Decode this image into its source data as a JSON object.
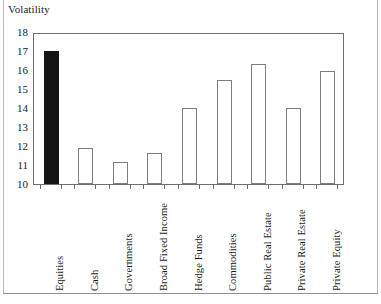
{
  "chart_data": {
    "type": "bar",
    "title": "Volatility",
    "xlabel": "",
    "ylabel": "Volatility",
    "ylim": [
      10,
      18
    ],
    "ytick_labels": [
      "18",
      "17",
      "16",
      "15",
      "14",
      "13",
      "12",
      "11",
      "10"
    ],
    "ytick_values": [
      18,
      17,
      16,
      15,
      14,
      13,
      12,
      11,
      10
    ],
    "grid": false,
    "legend": "none",
    "categories": [
      "Equities",
      "Cash",
      "Governments",
      "Broad Fixed Income",
      "Hedge Funds",
      "Commodities",
      "Public Real Estate",
      "Private Real Estate",
      "Private Equity"
    ],
    "values": [
      17.0,
      11.9,
      11.15,
      11.65,
      14.0,
      15.5,
      16.3,
      14.0,
      15.95
    ],
    "bar_styles": [
      "filled",
      "hollow",
      "hollow",
      "hollow",
      "hollow",
      "hollow",
      "hollow",
      "hollow",
      "hollow"
    ],
    "colors": {
      "filled_bar": "#141414",
      "hollow_bar_fill": "#ffffff",
      "hollow_bar_edge": "#7d7d7d",
      "axis": "#6e6e6e",
      "text": "#1a1a1a",
      "frame": "#b9b9b9",
      "background": "#ffffff"
    }
  }
}
